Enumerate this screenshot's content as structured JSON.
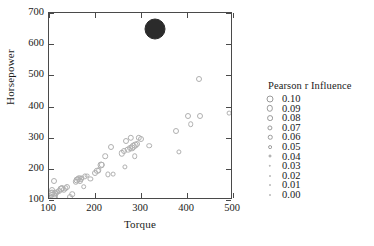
{
  "chart_data": {
    "type": "scatter",
    "title": "",
    "xlabel": "Torque",
    "ylabel": "Horsepower",
    "xlim": [
      100,
      500
    ],
    "ylim": [
      100,
      700
    ],
    "xticks": [
      100,
      200,
      300,
      400,
      500
    ],
    "yticks": [
      100,
      200,
      300,
      400,
      500,
      600,
      700
    ],
    "grid": false,
    "legend": {
      "title": "Pearson r Influence",
      "position": "right",
      "entries": [
        {
          "label": "0.10",
          "value": 0.1,
          "marker_size": 7.0
        },
        {
          "label": "0.09",
          "value": 0.09,
          "marker_size": 6.4
        },
        {
          "label": "0.08",
          "value": 0.08,
          "marker_size": 5.8
        },
        {
          "label": "0.07",
          "value": 0.07,
          "marker_size": 5.2
        },
        {
          "label": "0.06",
          "value": 0.06,
          "marker_size": 4.5
        },
        {
          "label": "0.05",
          "value": 0.05,
          "marker_size": 3.8
        },
        {
          "label": "0.04",
          "value": 0.04,
          "marker_size": 3.0
        },
        {
          "label": "0.03",
          "value": 0.03,
          "marker_size": 2.4
        },
        {
          "label": "0.02",
          "value": 0.02,
          "marker_size": 1.9
        },
        {
          "label": "0.01",
          "value": 0.01,
          "marker_size": 1.5
        },
        {
          "label": "0.00",
          "value": 0.0,
          "marker_size": 1.2
        }
      ]
    },
    "series": [
      {
        "name": "cars",
        "marker": "open-circle",
        "color": "#b0b0b0",
        "points": [
          {
            "x": 103,
            "y": 110,
            "size": 3.5
          },
          {
            "x": 105,
            "y": 118,
            "size": 4.0
          },
          {
            "x": 106,
            "y": 124,
            "size": 3.5
          },
          {
            "x": 107,
            "y": 132,
            "size": 3.0
          },
          {
            "x": 108,
            "y": 113,
            "size": 4.5
          },
          {
            "x": 110,
            "y": 161,
            "size": 3.0
          },
          {
            "x": 111,
            "y": 108,
            "size": 4.0
          },
          {
            "x": 113,
            "y": 120,
            "size": 3.5
          },
          {
            "x": 115,
            "y": 122,
            "size": 3.0
          },
          {
            "x": 118,
            "y": 127,
            "size": 2.8
          },
          {
            "x": 122,
            "y": 130,
            "size": 3.0
          },
          {
            "x": 125,
            "y": 135,
            "size": 3.5
          },
          {
            "x": 128,
            "y": 138,
            "size": 3.0
          },
          {
            "x": 132,
            "y": 133,
            "size": 3.2
          },
          {
            "x": 136,
            "y": 137,
            "size": 2.8
          },
          {
            "x": 140,
            "y": 142,
            "size": 3.0
          },
          {
            "x": 145,
            "y": 110,
            "size": 3.0
          },
          {
            "x": 150,
            "y": 118,
            "size": 2.8
          },
          {
            "x": 158,
            "y": 158,
            "size": 3.2
          },
          {
            "x": 160,
            "y": 163,
            "size": 3.5
          },
          {
            "x": 163,
            "y": 167,
            "size": 3.0
          },
          {
            "x": 166,
            "y": 171,
            "size": 2.8
          },
          {
            "x": 168,
            "y": 160,
            "size": 3.0
          },
          {
            "x": 170,
            "y": 168,
            "size": 3.0
          },
          {
            "x": 172,
            "y": 172,
            "size": 2.6
          },
          {
            "x": 175,
            "y": 143,
            "size": 2.8
          },
          {
            "x": 178,
            "y": 176,
            "size": 2.6
          },
          {
            "x": 182,
            "y": 178,
            "size": 2.4
          },
          {
            "x": 190,
            "y": 168,
            "size": 2.6
          },
          {
            "x": 200,
            "y": 188,
            "size": 3.0
          },
          {
            "x": 205,
            "y": 193,
            "size": 3.2
          },
          {
            "x": 208,
            "y": 196,
            "size": 2.8
          },
          {
            "x": 212,
            "y": 211,
            "size": 3.5
          },
          {
            "x": 215,
            "y": 212,
            "size": 3.2
          },
          {
            "x": 222,
            "y": 240,
            "size": 2.8
          },
          {
            "x": 228,
            "y": 182,
            "size": 2.6
          },
          {
            "x": 235,
            "y": 271,
            "size": 3.0
          },
          {
            "x": 240,
            "y": 183,
            "size": 2.4
          },
          {
            "x": 258,
            "y": 250,
            "size": 3.2
          },
          {
            "x": 262,
            "y": 256,
            "size": 3.0
          },
          {
            "x": 265,
            "y": 205,
            "size": 2.6
          },
          {
            "x": 268,
            "y": 290,
            "size": 3.0
          },
          {
            "x": 272,
            "y": 262,
            "size": 3.4
          },
          {
            "x": 275,
            "y": 266,
            "size": 3.0
          },
          {
            "x": 278,
            "y": 300,
            "size": 3.2
          },
          {
            "x": 280,
            "y": 268,
            "size": 3.6
          },
          {
            "x": 283,
            "y": 272,
            "size": 3.2
          },
          {
            "x": 286,
            "y": 240,
            "size": 2.8
          },
          {
            "x": 288,
            "y": 276,
            "size": 3.4
          },
          {
            "x": 291,
            "y": 280,
            "size": 3.0
          },
          {
            "x": 295,
            "y": 299,
            "size": 3.2
          },
          {
            "x": 300,
            "y": 297,
            "size": 3.0
          },
          {
            "x": 318,
            "y": 274,
            "size": 2.8
          },
          {
            "x": 375,
            "y": 322,
            "size": 3.0
          },
          {
            "x": 382,
            "y": 254,
            "size": 2.6
          },
          {
            "x": 402,
            "y": 371,
            "size": 3.0
          },
          {
            "x": 408,
            "y": 344,
            "size": 2.8
          },
          {
            "x": 425,
            "y": 489,
            "size": 3.0
          },
          {
            "x": 428,
            "y": 371,
            "size": 3.0
          },
          {
            "x": 492,
            "y": 380,
            "size": 2.4
          }
        ]
      },
      {
        "name": "influential-point",
        "marker": "filled-circle",
        "color": "#2b2b2b",
        "points": [
          {
            "x": 330,
            "y": 650,
            "size": 10.5
          }
        ]
      }
    ]
  }
}
